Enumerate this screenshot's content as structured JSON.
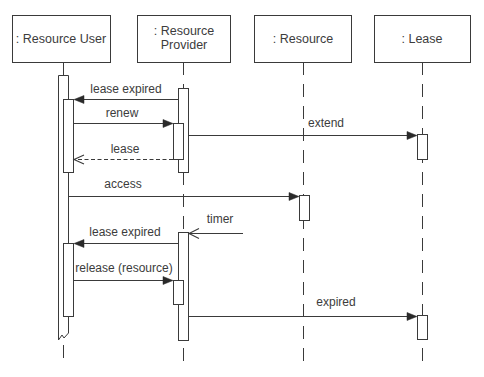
{
  "diagram": {
    "type": "UML sequence diagram",
    "participants": [
      {
        "id": "resource-user",
        "label": ": Resource User"
      },
      {
        "id": "resource-provider",
        "lines": [
          ": Resource",
          "Provider"
        ]
      },
      {
        "id": "resource",
        "label": ": Resource"
      },
      {
        "id": "lease",
        "label": ": Lease"
      }
    ],
    "messages": [
      {
        "label": "lease expired",
        "from": ": Resource Provider",
        "to": ": Resource User",
        "kind": "synchronous"
      },
      {
        "label": "renew",
        "from": ": Resource User",
        "to": ": Resource Provider",
        "kind": "synchronous"
      },
      {
        "label": "extend",
        "from": ": Resource Provider",
        "to": ": Lease",
        "kind": "synchronous"
      },
      {
        "label": "lease",
        "from": ": Resource Provider",
        "to": ": Resource User",
        "kind": "return"
      },
      {
        "label": "access",
        "from": ": Resource User",
        "to": ": Resource",
        "kind": "synchronous"
      },
      {
        "label": "timer",
        "from": "external",
        "to": ": Resource Provider",
        "kind": "asynchronous"
      },
      {
        "label": "lease expired",
        "from": ": Resource Provider",
        "to": ": Resource User",
        "kind": "synchronous"
      },
      {
        "label": "release (resource)",
        "from": ": Resource User",
        "to": ": Resource Provider",
        "kind": "synchronous"
      },
      {
        "label": "expired",
        "from": ": Resource Provider",
        "to": ": Lease",
        "kind": "synchronous"
      }
    ]
  }
}
